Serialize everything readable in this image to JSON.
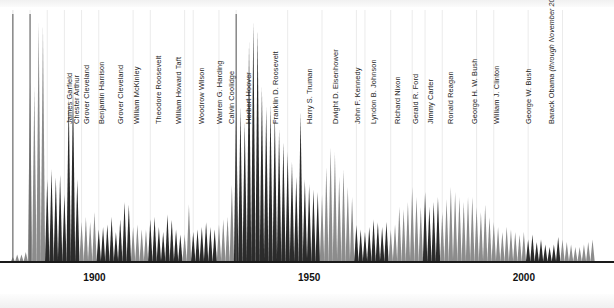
{
  "figure": {
    "background_color": "#ffffff",
    "axis_color": "#1a1a1a",
    "gridline_color": "#ebebeb",
    "peak_dark_color": "#2b2b2b",
    "peak_gray_color": "#8c8c8c",
    "label_color": "#1e1e1e"
  },
  "axis": {
    "arrow_name": "axis-arrow",
    "ticks": [
      {
        "label": "1900",
        "year": 1900
      },
      {
        "label": "1950",
        "year": 1950
      },
      {
        "label": "2000",
        "year": 2000
      }
    ],
    "year_min": 1878,
    "year_max": 2021,
    "baseline_y": 262
  },
  "chart_data": {
    "type": "area",
    "title": "",
    "subtitle": "",
    "xlabel": "",
    "ylabel": "",
    "xlim": [
      1878,
      2021
    ],
    "ylim": [
      0,
      100
    ],
    "grid": "vertical-only",
    "legend": "none",
    "annotations": [
      "James Garfield",
      "Chester Arthur",
      "Grover Cleveland",
      "Benjamin Harrison",
      "Grover Cleveland",
      "William McKinley",
      "Theodore Roosevelt",
      "William Howard Taft",
      "Woodrow Wilson",
      "Warren G. Harding",
      "Calvin Coolidge",
      "Herbert Hoover",
      "Franklin D. Roosevelt",
      "Harry S. Truman",
      "Dwight D. Eisenhower",
      "John F. Kennedy",
      "Lyndon B. Johnson",
      "Richard Nixon",
      "Gerald R. Ford",
      "Jimmy Carter",
      "Ronald Reagan",
      "George H. W. Bush",
      "William J. Clinton",
      "George W. Bush",
      "Barack Obama (through November 2016)"
    ],
    "x": [
      1881,
      1882,
      1883,
      1884,
      1885,
      1886,
      1887,
      1888,
      1889,
      1890,
      1891,
      1892,
      1893,
      1894,
      1895,
      1896,
      1897,
      1898,
      1899,
      1900,
      1901,
      1902,
      1903,
      1904,
      1905,
      1906,
      1907,
      1908,
      1909,
      1910,
      1911,
      1912,
      1913,
      1914,
      1915,
      1916,
      1917,
      1918,
      1919,
      1920,
      1921,
      1922,
      1923,
      1924,
      1925,
      1926,
      1927,
      1928,
      1929,
      1930,
      1931,
      1932,
      1933,
      1934,
      1935,
      1936,
      1937,
      1938,
      1939,
      1940,
      1941,
      1942,
      1943,
      1944,
      1945,
      1946,
      1947,
      1948,
      1949,
      1950,
      1951,
      1952,
      1953,
      1954,
      1955,
      1956,
      1957,
      1958,
      1959,
      1960,
      1961,
      1962,
      1963,
      1964,
      1965,
      1966,
      1967,
      1968,
      1969,
      1970,
      1971,
      1972,
      1973,
      1974,
      1975,
      1976,
      1977,
      1978,
      1979,
      1980,
      1981,
      1982,
      1983,
      1984,
      1985,
      1986,
      1987,
      1988,
      1989,
      1990,
      1991,
      1992,
      1993,
      1994,
      1995,
      1996,
      1997,
      1998,
      1999,
      2000,
      2001,
      2002,
      2003,
      2004,
      2005,
      2006,
      2007,
      2008,
      2009,
      2010,
      2011,
      2012,
      2013,
      2014,
      2015,
      2016
    ],
    "values": [
      2,
      3,
      3,
      4,
      72,
      70,
      96,
      95,
      33,
      37,
      34,
      35,
      27,
      66,
      71,
      33,
      16,
      18,
      16,
      20,
      13,
      14,
      15,
      18,
      12,
      17,
      24,
      23,
      14,
      15,
      13,
      13,
      17,
      18,
      14,
      12,
      19,
      17,
      13,
      11,
      11,
      23,
      12,
      13,
      14,
      16,
      14,
      13,
      15,
      17,
      18,
      31,
      63,
      62,
      56,
      88,
      96,
      93,
      70,
      62,
      63,
      60,
      53,
      48,
      44,
      40,
      34,
      60,
      33,
      31,
      29,
      28,
      27,
      38,
      46,
      44,
      34,
      37,
      30,
      26,
      15,
      13,
      12,
      14,
      17,
      16,
      14,
      16,
      13,
      15,
      22,
      21,
      24,
      30,
      26,
      22,
      28,
      22,
      24,
      26,
      20,
      25,
      30,
      28,
      26,
      24,
      26,
      26,
      22,
      20,
      23,
      18,
      16,
      14,
      12,
      14,
      13,
      12,
      11,
      12,
      9,
      11,
      8,
      9,
      7,
      6,
      7,
      10,
      9,
      8,
      7,
      6,
      6,
      7,
      8,
      9
    ],
    "series": [
      {
        "name": "Dark-shaded presidential term",
        "color": "#2b2b2b",
        "note": "alternating shading by presidential administration"
      },
      {
        "name": "Gray-shaded presidential term",
        "color": "#8c8c8c",
        "note": "alternating shading by presidential administration"
      }
    ],
    "presidents": [
      {
        "name": "James Garfield",
        "start": 1881,
        "end": 1881,
        "shade": "dark",
        "label_x": 71,
        "leader": false
      },
      {
        "name": "Chester Arthur",
        "start": 1881,
        "end": 1885,
        "shade": "gray",
        "label_x": 78,
        "leader": true
      },
      {
        "name": "Grover Cleveland",
        "start": 1885,
        "end": 1889,
        "shade": "gray",
        "label_x": 88,
        "leader": true
      },
      {
        "name": "Benjamin Harrison",
        "start": 1889,
        "end": 1893,
        "shade": "dark",
        "label_x": 103,
        "leader": false
      },
      {
        "name": "Grover Cleveland",
        "start": 1893,
        "end": 1897,
        "shade": "dark",
        "label_x": 122,
        "leader": false
      },
      {
        "name": "William McKinley",
        "start": 1897,
        "end": 1901,
        "shade": "gray",
        "label_x": 138,
        "leader": false
      },
      {
        "name": "Theodore Roosevelt",
        "start": 1901,
        "end": 1909,
        "shade": "dark",
        "label_x": 160,
        "leader": false
      },
      {
        "name": "William Howard Taft",
        "start": 1909,
        "end": 1913,
        "shade": "gray",
        "label_x": 180,
        "leader": false
      },
      {
        "name": "Woodrow Wilson",
        "start": 1913,
        "end": 1921,
        "shade": "dark",
        "label_x": 203,
        "leader": false
      },
      {
        "name": "Warren G. Harding",
        "start": 1921,
        "end": 1923,
        "shade": "gray",
        "label_x": 221,
        "leader": false
      },
      {
        "name": "Calvin Coolidge",
        "start": 1923,
        "end": 1929,
        "shade": "dark",
        "label_x": 233,
        "leader": false
      },
      {
        "name": "Herbert Hoover",
        "start": 1929,
        "end": 1933,
        "shade": "gray",
        "label_x": 250,
        "leader": false
      },
      {
        "name": "Franklin D. Roosevelt",
        "start": 1933,
        "end": 1945,
        "shade": "dark",
        "label_x": 277,
        "leader": true
      },
      {
        "name": "Harry S. Truman",
        "start": 1945,
        "end": 1953,
        "shade": "dark",
        "label_x": 311,
        "leader": false
      },
      {
        "name": "Dwight D. Eisenhower",
        "start": 1953,
        "end": 1961,
        "shade": "gray",
        "label_x": 337,
        "leader": false
      },
      {
        "name": "John F. Kennedy",
        "start": 1961,
        "end": 1963,
        "shade": "dark",
        "label_x": 359,
        "leader": false
      },
      {
        "name": "Lyndon B. Johnson",
        "start": 1963,
        "end": 1969,
        "shade": "dark",
        "label_x": 375,
        "leader": false
      },
      {
        "name": "Richard Nixon",
        "start": 1969,
        "end": 1974,
        "shade": "gray",
        "label_x": 399,
        "leader": false
      },
      {
        "name": "Gerald R. Ford",
        "start": 1974,
        "end": 1977,
        "shade": "gray",
        "label_x": 417,
        "leader": false
      },
      {
        "name": "Jimmy Carter",
        "start": 1977,
        "end": 1981,
        "shade": "dark",
        "label_x": 432,
        "leader": false
      },
      {
        "name": "Ronald Reagan",
        "start": 1981,
        "end": 1989,
        "shade": "gray",
        "label_x": 452,
        "leader": false
      },
      {
        "name": "George H. W. Bush",
        "start": 1989,
        "end": 1993,
        "shade": "gray",
        "label_x": 476,
        "leader": false
      },
      {
        "name": "William J. Clinton",
        "start": 1993,
        "end": 2001,
        "shade": "gray",
        "label_x": 498,
        "leader": false
      },
      {
        "name": "George W. Bush",
        "start": 2001,
        "end": 2009,
        "shade": "dark",
        "label_x": 530,
        "leader": false
      },
      {
        "name": "Barack Obama",
        "start": 2009,
        "end": 2016,
        "shade": "gray",
        "label_x": 553,
        "leader": false,
        "sub": "(through November 2016)"
      }
    ]
  }
}
